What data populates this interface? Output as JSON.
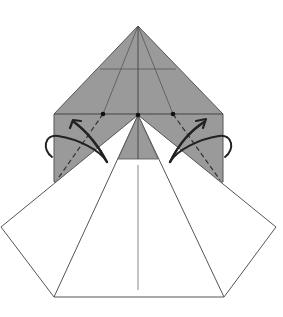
{
  "diagram": {
    "type": "origami-fold-step",
    "colors": {
      "paper_colored": "#9a9a9a",
      "paper_white": "#ffffff",
      "line": "#555555",
      "arrow": "#222222",
      "background": "#ffffff"
    },
    "elements": {
      "colored_layer": "gray-colored-side-of-paper",
      "white_fan": "white-flaps",
      "crease_lines": "valley-fold-dashed-lines",
      "fold_arrows": "fold-behind-arrows",
      "reference_dots": 3
    }
  }
}
